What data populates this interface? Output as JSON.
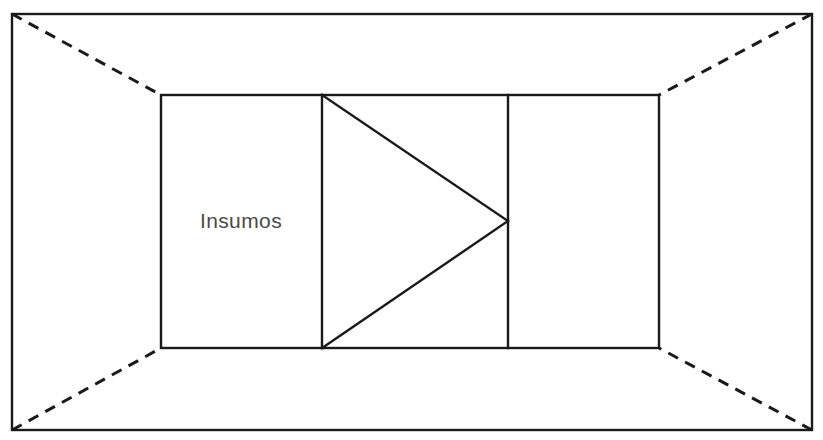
{
  "diagram": {
    "background_color": "#ffffff",
    "stroke_color": "#1a1a1a",
    "label_color": "#4a4a4a",
    "outer_boundary": {
      "name": "ambiente",
      "style": "solid",
      "x1": 12,
      "y1": 14,
      "x2": 812,
      "y2": 430
    },
    "inner_boundary": {
      "name": "sistema",
      "style": "solid",
      "x1": 161,
      "y1": 95,
      "x2": 659,
      "y2": 348
    },
    "dividers": [
      {
        "name": "divider-left",
        "x": 322,
        "y1": 95,
        "y2": 348
      },
      {
        "name": "divider-right",
        "x": 508,
        "y1": 95,
        "y2": 348
      }
    ],
    "arrow": {
      "name": "process-arrow",
      "apex_x": 508,
      "apex_y": 221,
      "base_x": 322,
      "base_top_y": 95,
      "base_bottom_y": 348
    },
    "perspective_lines": [
      {
        "name": "corner-top-left",
        "x1": 12,
        "y1": 14,
        "x2": 161,
        "y2": 95
      },
      {
        "name": "corner-top-right",
        "x1": 812,
        "y1": 14,
        "x2": 659,
        "y2": 95
      },
      {
        "name": "corner-bottom-left",
        "x1": 12,
        "y1": 430,
        "x2": 161,
        "y2": 348
      },
      {
        "name": "corner-bottom-right",
        "x1": 812,
        "y1": 430,
        "x2": 659,
        "y2": 348
      }
    ],
    "labels": [
      {
        "name": "insumos",
        "text": "Insumos",
        "x": 241,
        "y": 222
      }
    ]
  },
  "chart_data": {
    "type": "diagram",
    "title": "Insumos",
    "nodes": [
      {
        "id": "insumos",
        "label": "Insumos",
        "region": "left-cell"
      },
      {
        "id": "processo",
        "label": "",
        "region": "middle-cell"
      },
      {
        "id": "saida",
        "label": "",
        "region": "right-cell"
      }
    ],
    "annotations": [
      "Insumos"
    ]
  }
}
